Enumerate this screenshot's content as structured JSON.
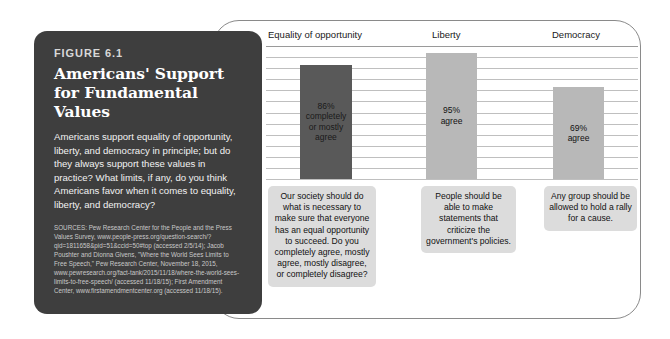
{
  "figure": {
    "kicker": "FIGURE 6.1",
    "title": "Americans' Support for Fundamental Values",
    "description": "Americans support equality of opportunity, liberty, and democracy in principle; but do they always support these values in practice? What limits, if any, do you think Americans favor when it comes to equality, liberty, and democracy?",
    "sources": "SOURCES: Pew Research Center for the People and the Press Values Survey, www.people-press.org/question-search/?qid=1811658&pid=51&ccid=50#top (accessed 2/5/14); Jacob Poushter and Dionna Givens, \"Where the World Sees Limits to Free Speech,\" Pew Research Center, November 18, 2015, www.pewresearch.org/fact-tank/2015/11/18/where-the-world-sees-limits-to-free-speech/ (accessed 11/18/15); First Amendment Center, www.firstamendmentcenter.org (accessed 11/18/15)."
  },
  "colors": {
    "panel_background": "#3e3e3e",
    "bar_dark": "#595959",
    "bar_light": "#b8b8b8",
    "callout_background": "#dcdcdc",
    "gridline": "#bfbfbf",
    "frame_border": "#8a8a8a"
  },
  "chart_data": {
    "type": "bar",
    "title": "Americans' Support for Fundamental Values",
    "xlabel": "",
    "ylabel": "",
    "ylim": [
      0,
      100
    ],
    "grid": true,
    "legend": "none",
    "categories": [
      "Equality of opportunity",
      "Liberty",
      "Democracy"
    ],
    "values": [
      86,
      95,
      69
    ],
    "value_labels": [
      "86%\ncompletely\nor mostly\nagree",
      "95%\nagree",
      "69%\nagree"
    ],
    "bar_colors": [
      "#595959",
      "#b8b8b8",
      "#b8b8b8"
    ],
    "bar_text_colors": [
      "#1a1a1a",
      "#111111",
      "#111111"
    ],
    "annotations": [
      "Our society should do what is necessary to make sure that everyone has an equal opportunity to succeed. Do you completely agree, mostly agree, mostly disagree, or completely disagree?",
      "People should be able to make statements that criticize the government's policies.",
      "Any group should be allowed to hold a rally for a cause."
    ],
    "gridline_count": 12
  }
}
